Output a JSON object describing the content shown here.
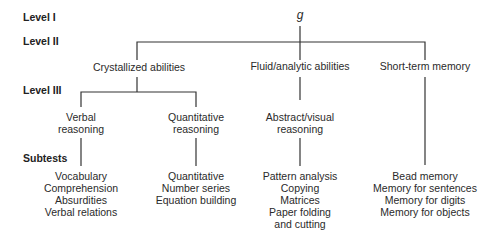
{
  "levels": {
    "level1": "Level I",
    "level2": "Level II",
    "level3": "Level III",
    "subtests": "Subtests"
  },
  "root": {
    "label": "g"
  },
  "level2_nodes": [
    {
      "label": "Crystallized abilities"
    },
    {
      "label": "Fluid/analytic abilities"
    },
    {
      "label": "Short-term memory"
    }
  ],
  "level3_nodes": [
    {
      "line1": "Verbal",
      "line2": "reasoning"
    },
    {
      "line1": "Quantitative",
      "line2": "reasoning"
    },
    {
      "line1": "Abstract/visual",
      "line2": "reasoning"
    }
  ],
  "subtests": {
    "verbal": [
      "Vocabulary",
      "Comprehension",
      "Absurdities",
      "Verbal relations"
    ],
    "quantitative": [
      "Quantitative",
      "Number series",
      "Equation building"
    ],
    "abstract_visual": [
      "Pattern analysis",
      "Copying",
      "Matrices",
      "Paper folding",
      "and cutting"
    ],
    "short_term_memory": [
      "Bead memory",
      "Memory for sentences",
      "Memory for digits",
      "Memory for objects"
    ]
  },
  "colors": {
    "line": "#333333",
    "text": "#2a2a2a"
  }
}
